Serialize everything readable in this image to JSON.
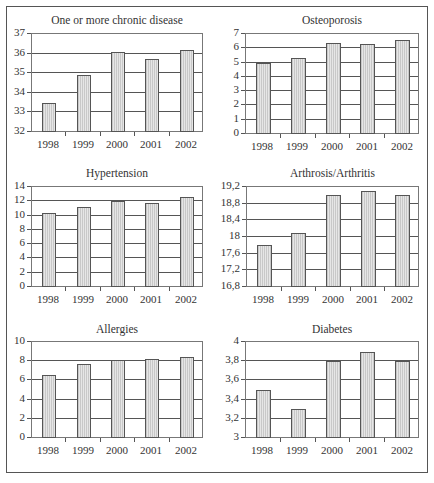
{
  "chart_data": [
    {
      "type": "bar",
      "title": "One or more chronic disease",
      "categories": [
        "1998",
        "1999",
        "2000",
        "2001",
        "2002"
      ],
      "values": [
        33.5,
        34.9,
        36.1,
        35.7,
        36.2
      ],
      "yticks": [
        "37",
        "36",
        "35",
        "34",
        "33",
        "32"
      ],
      "ylim": [
        32,
        37
      ],
      "xlabel": "",
      "ylabel": "",
      "grid": true,
      "legend": null
    },
    {
      "type": "bar",
      "title": "Osteoporosis",
      "categories": [
        "1998",
        "1999",
        "2000",
        "2001",
        "2002"
      ],
      "values": [
        5.0,
        5.3,
        6.4,
        6.3,
        6.6
      ],
      "yticks": [
        "7",
        "6",
        "5",
        "4",
        "3",
        "2",
        "1",
        "0"
      ],
      "ylim": [
        0,
        7
      ],
      "xlabel": "",
      "ylabel": "",
      "grid": true,
      "legend": null
    },
    {
      "type": "bar",
      "title": "Hypertension",
      "categories": [
        "1998",
        "1999",
        "2000",
        "2001",
        "2002"
      ],
      "values": [
        10.3,
        11.2,
        12.1,
        11.7,
        12.6
      ],
      "yticks": [
        "14",
        "12",
        "10",
        "8",
        "6",
        "4",
        "2",
        "0"
      ],
      "ylim": [
        0,
        14
      ],
      "xlabel": "",
      "ylabel": "",
      "grid": true,
      "legend": null
    },
    {
      "type": "bar",
      "title": "Arthrosis/Arthritis",
      "categories": [
        "1998",
        "1999",
        "2000",
        "2001",
        "2002"
      ],
      "values": [
        17.8,
        18.1,
        19.0,
        19.1,
        19.0
      ],
      "yticks": [
        "19,2",
        "18,8",
        "18,4",
        "18",
        "17,6",
        "17,2",
        "16,8"
      ],
      "ylim": [
        16.8,
        19.2
      ],
      "xlabel": "",
      "ylabel": "",
      "grid": true,
      "legend": null
    },
    {
      "type": "bar",
      "title": "Allergies",
      "categories": [
        "1998",
        "1999",
        "2000",
        "2001",
        "2002"
      ],
      "values": [
        6.6,
        7.7,
        8.1,
        8.2,
        8.4
      ],
      "yticks": [
        "10",
        "8",
        "6",
        "4",
        "2",
        "0"
      ],
      "ylim": [
        0,
        10
      ],
      "xlabel": "",
      "ylabel": "",
      "grid": true,
      "legend": null
    },
    {
      "type": "bar",
      "title": "Diabetes",
      "categories": [
        "1998",
        "1999",
        "2000",
        "2001",
        "2002"
      ],
      "values": [
        3.5,
        3.3,
        3.8,
        3.9,
        3.8
      ],
      "yticks": [
        "4",
        "3,8",
        "3,6",
        "3,4",
        "3,2",
        "3"
      ],
      "ylim": [
        3,
        4
      ],
      "xlabel": "",
      "ylabel": "",
      "grid": true,
      "legend": null
    }
  ],
  "layout": {
    "charts": [
      {
        "plot": {
          "left": 31,
          "top": 33,
          "width": 172,
          "height": 99
        },
        "title_y": 14
      },
      {
        "plot": {
          "left": 245,
          "top": 33,
          "width": 174,
          "height": 101
        },
        "title_y": 14
      },
      {
        "plot": {
          "left": 31,
          "top": 186,
          "width": 172,
          "height": 101
        },
        "title_y": 167
      },
      {
        "plot": {
          "left": 246,
          "top": 186,
          "width": 173,
          "height": 101
        },
        "title_y": 167
      },
      {
        "plot": {
          "left": 31,
          "top": 341,
          "width": 172,
          "height": 97
        },
        "title_y": 323
      },
      {
        "plot": {
          "left": 245,
          "top": 341,
          "width": 174,
          "height": 97
        },
        "title_y": 323
      }
    ],
    "bar_color": "#d9d9d9",
    "grid_color": "#555555"
  }
}
